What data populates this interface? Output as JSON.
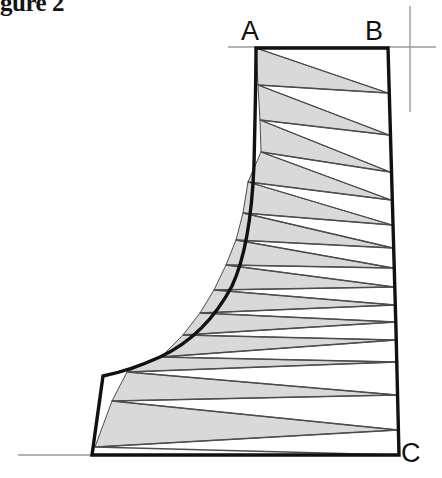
{
  "figure": {
    "caption": "gure 2",
    "caption_full_hint": "gure 2"
  },
  "labels": {
    "a": "A",
    "b": "B",
    "c": "C"
  },
  "colors": {
    "outline": "#111111",
    "band_fill": "#d9d9d9",
    "band_stroke": "#4d4d4d",
    "guide_line": "#9a9a9a",
    "background": "#ffffff",
    "text": "#111111"
  },
  "chart_data": {
    "type": "line",
    "title": "gure 2",
    "xlabel": "",
    "ylabel": "",
    "legend": [],
    "annotations": [
      {
        "text": "A",
        "x": 252,
        "y": 30
      },
      {
        "text": "B",
        "x": 376,
        "y": 30
      },
      {
        "text": "C",
        "x": 412,
        "y": 452
      }
    ],
    "outline_points": [
      [
        256,
        48
      ],
      [
        388,
        48
      ],
      [
        390,
        120
      ],
      [
        392,
        200
      ],
      [
        395,
        280
      ],
      [
        397,
        360
      ],
      [
        399,
        455
      ],
      [
        92,
        455
      ],
      [
        103,
        376
      ],
      [
        130,
        369
      ],
      [
        160,
        358
      ],
      [
        190,
        340
      ],
      [
        214,
        316
      ],
      [
        232,
        286
      ],
      [
        244,
        250
      ],
      [
        251,
        205
      ],
      [
        254,
        150
      ],
      [
        256,
        95
      ]
    ],
    "zigzag_points": [
      [
        256,
        48
      ],
      [
        388,
        93
      ],
      [
        258,
        85
      ],
      [
        389,
        135
      ],
      [
        260,
        120
      ],
      [
        390,
        172
      ],
      [
        261,
        152
      ],
      [
        391,
        200
      ],
      [
        248,
        182
      ],
      [
        392,
        225
      ],
      [
        243,
        213
      ],
      [
        393,
        248
      ],
      [
        236,
        240
      ],
      [
        393,
        268
      ],
      [
        226,
        265
      ],
      [
        394,
        287
      ],
      [
        214,
        290
      ],
      [
        395,
        305
      ],
      [
        200,
        313
      ],
      [
        396,
        322
      ],
      [
        183,
        335
      ],
      [
        396,
        340
      ],
      [
        161,
        357
      ],
      [
        397,
        362
      ],
      [
        127,
        372
      ],
      [
        397,
        395
      ],
      [
        112,
        401
      ],
      [
        398,
        430
      ],
      [
        95,
        447
      ],
      [
        399,
        455
      ]
    ],
    "guide_lines": [
      {
        "x1": 228,
        "y1": 47,
        "x2": 436,
        "y2": 47,
        "orientation": "horizontal"
      },
      {
        "x1": 410,
        "y1": 6,
        "x2": 410,
        "y2": 110,
        "orientation": "vertical"
      },
      {
        "x1": 18,
        "y1": 455,
        "x2": 94,
        "y2": 455,
        "orientation": "horizontal"
      }
    ],
    "grid": false
  }
}
